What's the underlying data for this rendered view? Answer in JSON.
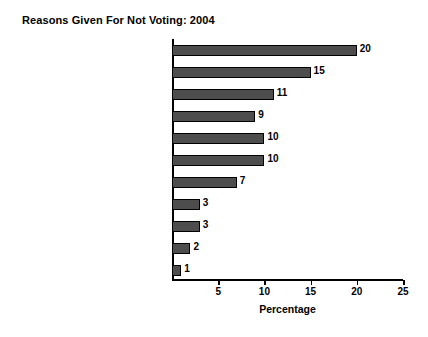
{
  "chart_data": {
    "type": "bar",
    "orientation": "horizontal",
    "title": "Reasons Given For Not Voting: 2004",
    "xlabel": "Percentage",
    "ylabel": "",
    "xlim": [
      0,
      25
    ],
    "xticks": [
      0,
      5,
      10,
      15,
      20,
      25
    ],
    "xtick_labels": [
      "",
      "5",
      "10",
      "15",
      "20",
      "25"
    ],
    "grid": false,
    "legend": false,
    "bar_color": "#4d4d4d",
    "bar_edge_color": "#000000",
    "background_color": "#ffffff",
    "show_value_labels": true,
    "categories": [
      "Too busy",
      "Illness or emergency",
      "Not interested",
      "Out of town",
      "Didn't like candidates",
      "Don't know",
      "Registration problems",
      "Forgot",
      "Inconvenient polling place",
      "Transportation problem",
      "Bad weather"
    ],
    "values": [
      20,
      15,
      11,
      9,
      10,
      10,
      7,
      3,
      3,
      2,
      1
    ],
    "value_labels": [
      "20",
      "15",
      "11",
      "9",
      "10",
      "10",
      "7",
      "3",
      "3",
      "2",
      "1"
    ]
  }
}
